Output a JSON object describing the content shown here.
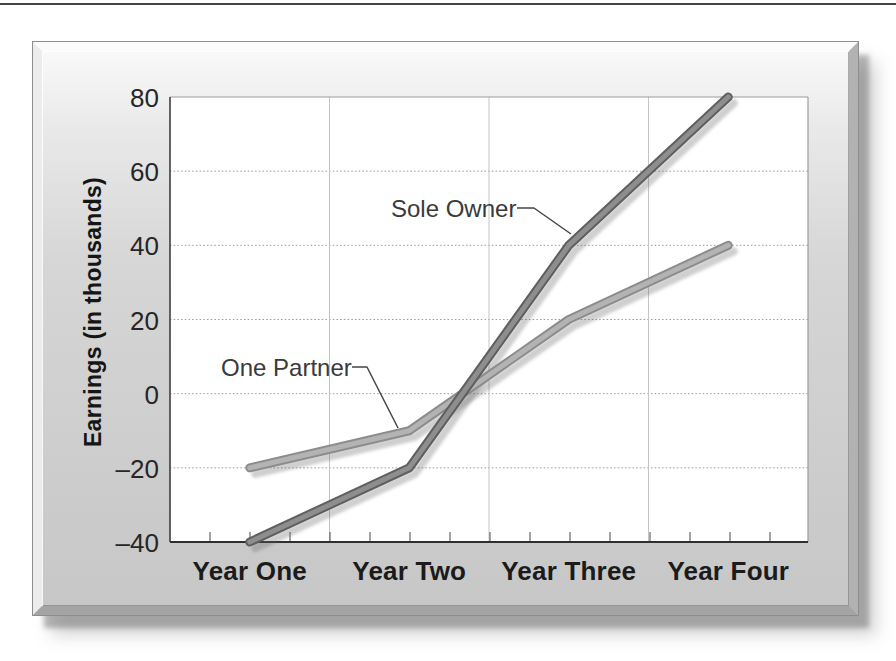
{
  "chart_data": {
    "type": "line",
    "title": "",
    "xlabel": "",
    "ylabel": "Earnings (in thousands)",
    "categories": [
      "Year One",
      "Year Two",
      "Year Three",
      "Year Four"
    ],
    "series": [
      {
        "name": "Sole Owner",
        "values": [
          -40,
          -20,
          40,
          80
        ]
      },
      {
        "name": "One Partner",
        "values": [
          -20,
          -10,
          20,
          40
        ]
      }
    ],
    "ylim": [
      -40,
      80
    ],
    "ytick_step": 20,
    "ytick_labels": [
      "80",
      "60",
      "40",
      "20",
      "0",
      "–20",
      "–40"
    ],
    "grid": true,
    "legend_position": "inline-annotations",
    "annotations": [
      {
        "label": "Sole Owner",
        "series": "Sole Owner"
      },
      {
        "label": "One Partner",
        "series": "One Partner"
      }
    ],
    "colors": {
      "sole_owner_core": "#8e8e8e",
      "sole_owner_edge": "#5f5f5f",
      "one_partner_core": "#b3b3b3",
      "one_partner_edge": "#8c8c8c",
      "panel_surface": "#d2d2d2",
      "plot_background": "#ffffff",
      "gridline": "#9a9a9a",
      "axis": "#2f2f2f"
    }
  }
}
